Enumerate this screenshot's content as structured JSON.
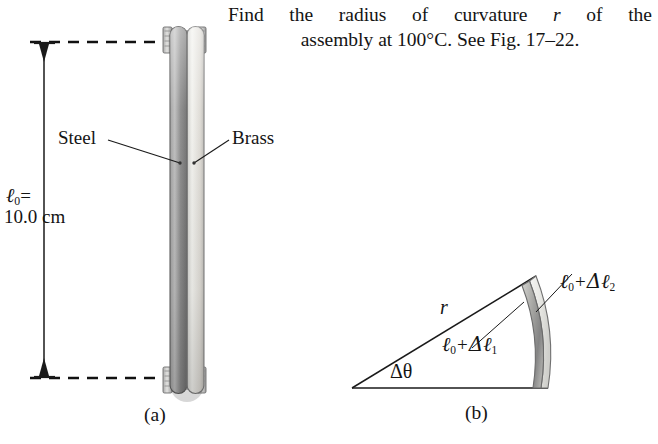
{
  "problem": {
    "line1_part1": "Find",
    "line1_part2": "the",
    "line1_part3": "radius",
    "line1_part4": "of",
    "line1_part5": "curvature",
    "line1_var": "r",
    "line1_part6": "of",
    "line1_part7": "the",
    "line2": "assembly at 100°C. See Fig. 17–22."
  },
  "figure_a": {
    "caption": "(a)",
    "length_label_symbol": "ℓ",
    "length_label_sub": "0",
    "length_label_eq": "=",
    "length_value": "10.0 cm",
    "material_left": "Steel",
    "material_right": "Brass",
    "colors": {
      "steel": "#8c8c8c",
      "brass": "#d8d8d4",
      "line": "#1a1a1a",
      "dash": "#111111"
    }
  },
  "figure_b": {
    "caption": "(b)",
    "radius_label": "r",
    "angle_label": "Δθ",
    "inner_arc_symbol": "ℓ",
    "inner_arc_sub0": "0",
    "inner_arc_plus": "+",
    "inner_arc_delta": "Δℓ",
    "inner_arc_sub": "1",
    "outer_arc_sub": "2",
    "colors": {
      "strip_light": "#ededea",
      "strip_dark": "#9a9a9a",
      "line": "#1a1a1a"
    }
  }
}
